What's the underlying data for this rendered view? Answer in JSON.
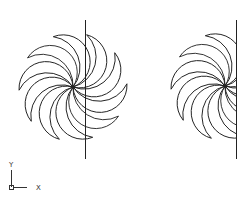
{
  "drawing": {
    "background": "#ffffff",
    "stroke_color": "#222222",
    "figures": [
      {
        "name": "full-pinwheel",
        "center": [
          73,
          87
        ],
        "radius": 50,
        "blades": 10,
        "mirror_line": {
          "x": 85,
          "y1": 20,
          "y2": 159
        },
        "clipped": false
      },
      {
        "name": "half-pinwheel",
        "center": [
          225,
          86
        ],
        "radius": 50,
        "blades": 10,
        "mirror_line": {
          "x": 236,
          "y1": 20,
          "y2": 159
        },
        "clipped": true
      }
    ]
  },
  "ucs_icon": {
    "y_label": "Y",
    "x_label": "X"
  }
}
